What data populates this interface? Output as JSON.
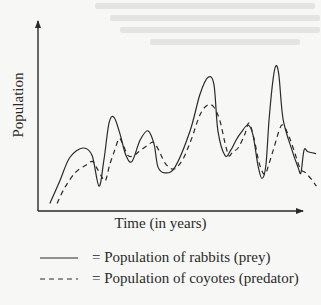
{
  "chart_data": {
    "type": "line",
    "title": "",
    "xlabel": "Time (in years)",
    "ylabel": "Population",
    "xlim": [
      0,
      100
    ],
    "ylim": [
      0,
      100
    ],
    "grid": false,
    "ticks": false,
    "legend_position": "bottom",
    "series": [
      {
        "name": "Population of rabbits (prey)",
        "legend_label": "= Population of rabbits (prey)",
        "style": "solid",
        "color": "#2a2a2a",
        "points": [
          [
            4.5,
            4
          ],
          [
            8.3,
            16
          ],
          [
            12,
            28
          ],
          [
            17,
            33
          ],
          [
            20.4,
            29
          ],
          [
            23,
            13
          ],
          [
            24.9,
            27
          ],
          [
            26.8,
            46
          ],
          [
            28.7,
            49
          ],
          [
            31,
            40
          ],
          [
            33.2,
            29
          ],
          [
            35.5,
            26
          ],
          [
            38.5,
            37
          ],
          [
            41.5,
            42
          ],
          [
            43.8,
            35
          ],
          [
            45.3,
            23
          ],
          [
            47.9,
            20
          ],
          [
            51.7,
            23
          ],
          [
            57.4,
            42
          ],
          [
            61.1,
            61
          ],
          [
            64.2,
            70
          ],
          [
            66.4,
            66
          ],
          [
            67.9,
            42
          ],
          [
            70.6,
            29
          ],
          [
            72.8,
            32
          ],
          [
            74.7,
            37
          ],
          [
            76.6,
            41
          ],
          [
            79.2,
            45
          ],
          [
            81.1,
            40
          ],
          [
            83,
            24
          ],
          [
            84.5,
            17
          ],
          [
            86,
            24
          ],
          [
            87.2,
            48
          ],
          [
            88.7,
            69
          ],
          [
            89.8,
            76
          ],
          [
            90.9,
            71
          ],
          [
            92.5,
            48
          ],
          [
            95.8,
            32
          ],
          [
            98.1,
            23
          ],
          [
            99.2,
            20
          ],
          [
            100.4,
            32
          ],
          [
            101.9,
            31
          ],
          [
            104.9,
            30
          ]
        ]
      },
      {
        "name": "Population of coyotes (predator)",
        "legend_label": "= Population of coyotes (predator)",
        "style": "dashed",
        "color": "#2a2a2a",
        "points": [
          [
            7.2,
            4
          ],
          [
            10,
            12
          ],
          [
            14,
            20
          ],
          [
            18,
            24
          ],
          [
            20.5,
            26
          ],
          [
            22,
            23
          ],
          [
            24,
            18
          ],
          [
            25.5,
            16
          ],
          [
            27,
            24
          ],
          [
            29,
            32
          ],
          [
            30.6,
            38
          ],
          [
            32,
            35
          ],
          [
            34,
            29
          ],
          [
            36,
            29
          ],
          [
            38,
            31
          ],
          [
            41,
            34
          ],
          [
            43.5,
            36
          ],
          [
            45.5,
            32
          ],
          [
            48,
            25
          ],
          [
            50.5,
            22
          ],
          [
            52.5,
            23
          ],
          [
            55,
            28
          ],
          [
            58,
            38
          ],
          [
            61,
            50
          ],
          [
            63.5,
            55
          ],
          [
            66,
            55
          ],
          [
            68.5,
            48
          ],
          [
            70.5,
            36
          ],
          [
            72,
            29
          ],
          [
            73.5,
            31
          ],
          [
            75.5,
            33
          ],
          [
            78,
            40
          ],
          [
            79.6,
            46
          ],
          [
            81.5,
            38
          ],
          [
            83.5,
            25
          ],
          [
            85.5,
            19
          ],
          [
            87,
            24
          ],
          [
            89,
            33
          ],
          [
            91.5,
            44
          ],
          [
            93,
            44
          ],
          [
            95,
            38
          ],
          [
            97,
            30
          ],
          [
            99,
            22
          ],
          [
            101,
            20
          ],
          [
            103.5,
            16
          ],
          [
            105,
            13
          ]
        ]
      }
    ]
  }
}
